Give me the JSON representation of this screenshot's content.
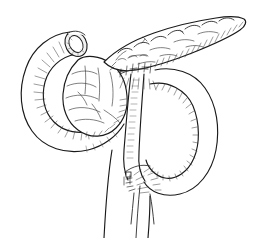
{
  "figure": {
    "caption": "",
    "medium": "pen-and-ink line drawing",
    "background_color": "#ffffff",
    "ink_color": "#1a1a1a",
    "hatching_color": "#3a3a3a",
    "width": 255,
    "height": 238
  },
  "structures": [
    {
      "id": "duodenal-stump",
      "label": "Duodenal stump (open lumen)",
      "description": "Transected proximal duodenum shown as an open elliptical ring at upper left",
      "center": [
        76,
        44
      ],
      "shading": "cut-edge ellipse with inner lumen"
    },
    {
      "id": "duodenum-c-loop",
      "label": "Duodenal C-loop",
      "description": "C-shaped duodenal loop sweeping left and inferior around the pancreatic head",
      "center": [
        58,
        95
      ],
      "shading": "dense parallel hatching along inner curvature"
    },
    {
      "id": "pancreas-head",
      "label": "Pancreatic head",
      "description": "Lobulated bulbous head cradled within the duodenal C-loop",
      "center": [
        92,
        92
      ],
      "shading": "irregular lobular contour lines"
    },
    {
      "id": "pancreas-body-tail",
      "label": "Pancreatic body and tail",
      "description": "Elongated lobulated body tapering to the tail, directed superiorly to the right",
      "center": [
        180,
        40
      ],
      "shading": "scalloped superior border, hatching on inferior border"
    },
    {
      "id": "pancreaticojejunal-anastomosis",
      "label": "Upper anastomosis (pancreaticojejunostomy)",
      "description": "Suture line with interrupted stitch marks where the jejunal limb meets the pancreas",
      "center": [
        140,
        68
      ],
      "shading": "row of short cross stitches"
    },
    {
      "id": "roux-limb",
      "label": "Roux-en-Y jejunal limb",
      "description": "Tubular jejunal loop descending on the right, curving into a U and ascending",
      "center": [
        190,
        120
      ],
      "shading": "hatched shading along inner wall of the loop"
    },
    {
      "id": "jejunojejunal-anastomosis",
      "label": "Lower anastomosis (jejunojejunostomy)",
      "description": "Second suture line with stitch marks at the distal limb junction",
      "center": [
        140,
        180
      ],
      "shading": "short stitch marks with radial hatching"
    },
    {
      "id": "efferent-limb",
      "label": "Efferent bowel limb",
      "description": "Two long parallel bowel walls running inferiorly off the bottom edge",
      "center": [
        140,
        215
      ],
      "shading": "plain contour lines"
    }
  ],
  "annotations": {
    "labels_present": false,
    "leader_lines_present": false,
    "text_visible": ""
  }
}
